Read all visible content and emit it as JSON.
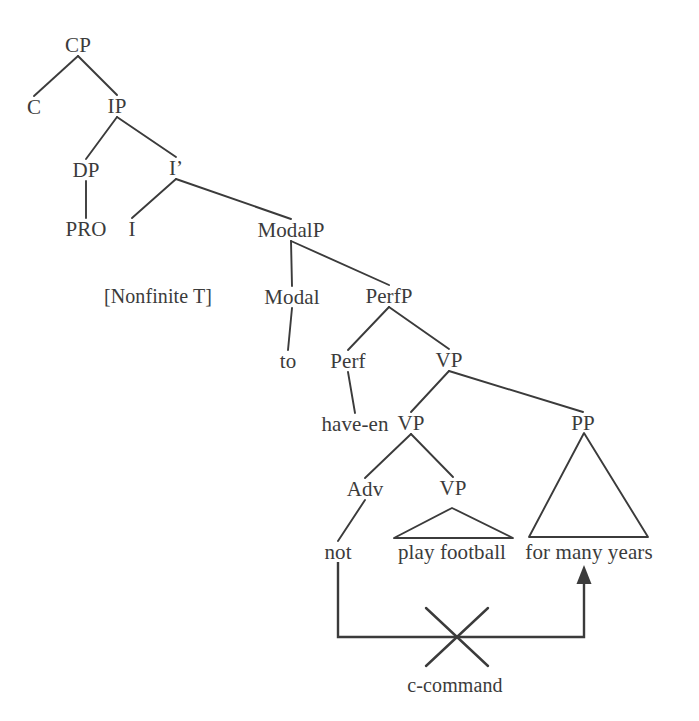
{
  "diagram": {
    "kind": "syntax-tree",
    "title_text": "",
    "colors": {
      "ink": "#3b3b3b",
      "line": "#3b3b3b",
      "background": "#ffffff"
    },
    "nodes": [
      {
        "id": "CP",
        "label": "CP",
        "x": 78,
        "y": 45,
        "type": "nonterminal"
      },
      {
        "id": "C",
        "label": "C",
        "x": 34,
        "y": 107,
        "type": "nonterminal"
      },
      {
        "id": "IP",
        "label": "IP",
        "x": 117,
        "y": 106,
        "type": "nonterminal"
      },
      {
        "id": "DP",
        "label": "DP",
        "x": 86,
        "y": 170,
        "type": "nonterminal"
      },
      {
        "id": "Ibar",
        "label": "I’",
        "x": 176,
        "y": 168,
        "type": "nonterminal"
      },
      {
        "id": "PRO",
        "label": "PRO",
        "x": 86,
        "y": 229,
        "type": "terminal"
      },
      {
        "id": "I",
        "label": "I",
        "x": 132,
        "y": 229,
        "type": "nonterminal"
      },
      {
        "id": "ModalP",
        "label": "ModalP",
        "x": 291,
        "y": 230,
        "type": "nonterminal"
      },
      {
        "id": "NonfiniteT",
        "label": "[Nonfinite T]",
        "x": 158,
        "y": 296,
        "type": "feature"
      },
      {
        "id": "Modal",
        "label": "Modal",
        "x": 292,
        "y": 297,
        "type": "nonterminal"
      },
      {
        "id": "PerfP",
        "label": "PerfP",
        "x": 389,
        "y": 296,
        "type": "nonterminal"
      },
      {
        "id": "to",
        "label": "to",
        "x": 288,
        "y": 361,
        "type": "terminal"
      },
      {
        "id": "Perf",
        "label": "Perf",
        "x": 348,
        "y": 361,
        "type": "nonterminal"
      },
      {
        "id": "VP_top",
        "label": "VP",
        "x": 449,
        "y": 360,
        "type": "nonterminal"
      },
      {
        "id": "have_en",
        "label": "have-en",
        "x": 355,
        "y": 424,
        "type": "terminal"
      },
      {
        "id": "VP_mid",
        "label": "VP",
        "x": 411,
        "y": 423,
        "type": "nonterminal"
      },
      {
        "id": "PP",
        "label": "PP",
        "x": 583,
        "y": 423,
        "type": "nonterminal"
      },
      {
        "id": "Adv",
        "label": "Adv",
        "x": 365,
        "y": 489,
        "type": "nonterminal"
      },
      {
        "id": "VP_low",
        "label": "VP",
        "x": 453,
        "y": 488,
        "type": "nonterminal"
      },
      {
        "id": "not",
        "label": "not",
        "x": 338,
        "y": 552,
        "type": "terminal"
      },
      {
        "id": "play_football",
        "label": "play football",
        "x": 452,
        "y": 552,
        "type": "terminal"
      },
      {
        "id": "for_many_years",
        "label": "for many years",
        "x": 589,
        "y": 552,
        "type": "terminal"
      },
      {
        "id": "c_command",
        "label": "c-command",
        "x": 455,
        "y": 685,
        "type": "annot"
      }
    ],
    "edges": [
      {
        "from": "CP",
        "to": "C",
        "kind": "branch"
      },
      {
        "from": "CP",
        "to": "IP",
        "kind": "branch"
      },
      {
        "from": "IP",
        "to": "DP",
        "kind": "branch"
      },
      {
        "from": "IP",
        "to": "Ibar",
        "kind": "branch"
      },
      {
        "from": "DP",
        "to": "PRO",
        "kind": "stem"
      },
      {
        "from": "Ibar",
        "to": "I",
        "kind": "branch"
      },
      {
        "from": "Ibar",
        "to": "ModalP",
        "kind": "branch"
      },
      {
        "from": "ModalP",
        "to": "Modal",
        "kind": "branch"
      },
      {
        "from": "ModalP",
        "to": "PerfP",
        "kind": "branch"
      },
      {
        "from": "Modal",
        "to": "to",
        "kind": "stem"
      },
      {
        "from": "PerfP",
        "to": "Perf",
        "kind": "branch"
      },
      {
        "from": "PerfP",
        "to": "VP_top",
        "kind": "branch"
      },
      {
        "from": "Perf",
        "to": "have_en",
        "kind": "stem"
      },
      {
        "from": "VP_top",
        "to": "VP_mid",
        "kind": "branch"
      },
      {
        "from": "VP_top",
        "to": "PP",
        "kind": "branch"
      },
      {
        "from": "VP_mid",
        "to": "Adv",
        "kind": "branch"
      },
      {
        "from": "VP_mid",
        "to": "VP_low",
        "kind": "branch"
      },
      {
        "from": "Adv",
        "to": "not",
        "kind": "stem"
      },
      {
        "from": "VP_low",
        "to": "play_football",
        "kind": "triangle"
      },
      {
        "from": "PP",
        "to": "for_many_years",
        "kind": "triangle"
      }
    ],
    "triangles": [
      {
        "id": "vp-low-triangle",
        "apex_x": 452,
        "apex_y": 508,
        "left_x": 394,
        "right_x": 513,
        "base_y": 538
      },
      {
        "id": "pp-triangle",
        "apex_x": 584,
        "apex_y": 433,
        "left_x": 529,
        "right_x": 648,
        "base_y": 537
      }
    ],
    "annotation": {
      "label": "c-command",
      "label_x": 455,
      "label_y": 685,
      "crossed_out": true,
      "path": {
        "start_x": 338,
        "start_y": 562,
        "bottom_y": 637,
        "end_x": 584,
        "end_y": 565
      },
      "cross": {
        "center_x": 457,
        "center_y": 637,
        "half_w": 31,
        "half_h": 29
      }
    }
  }
}
